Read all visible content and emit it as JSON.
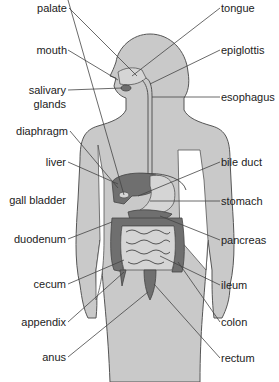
{
  "diagram": {
    "colors": {
      "body": "#c9c9c9",
      "organ_dark": "#6f6f6f",
      "organ_mid": "#9a9a9a",
      "outline": "#555555",
      "text": "#222222",
      "background": "#ffffff"
    },
    "labels_left": [
      {
        "id": "palate",
        "text": "palate"
      },
      {
        "id": "mouth",
        "text": "mouth"
      },
      {
        "id": "salivary-glands",
        "text": "salivary\nglands",
        "line1": "salivary",
        "line2": "glands"
      },
      {
        "id": "diaphragm",
        "text": "diaphragm"
      },
      {
        "id": "liver",
        "text": "liver"
      },
      {
        "id": "gall-bladder",
        "text": "gall bladder"
      },
      {
        "id": "duodenum",
        "text": "duodenum"
      },
      {
        "id": "cecum",
        "text": "cecum"
      },
      {
        "id": "appendix",
        "text": "appendix"
      },
      {
        "id": "anus",
        "text": "anus"
      }
    ],
    "labels_right": [
      {
        "id": "tongue",
        "text": "tongue"
      },
      {
        "id": "epiglottis",
        "text": "epiglottis"
      },
      {
        "id": "esophagus",
        "text": "esophagus"
      },
      {
        "id": "bile-duct",
        "text": "bile duct"
      },
      {
        "id": "stomach",
        "text": "stomach"
      },
      {
        "id": "pancreas",
        "text": "pancreas"
      },
      {
        "id": "ileum",
        "text": "ileum"
      },
      {
        "id": "colon",
        "text": "colon"
      },
      {
        "id": "rectum",
        "text": "rectum"
      }
    ]
  }
}
